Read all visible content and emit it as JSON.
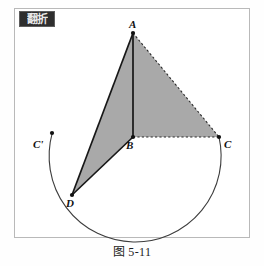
{
  "figure": {
    "badge_text": "翻折",
    "caption": "图 5-11",
    "frame_color": "#b9b9b9",
    "shade_color": "#a8a8a8",
    "stroke_color": "#1b1b1b"
  },
  "labels": {
    "a": "A",
    "b": "B",
    "c": "C",
    "c_prime": "C'",
    "d": "D"
  },
  "geometry": {
    "points": {
      "A": {
        "x": 133,
        "y": 33
      },
      "B": {
        "x": 133,
        "y": 137
      },
      "C": {
        "x": 219,
        "y": 137
      },
      "D": {
        "x": 72,
        "y": 195
      },
      "Cprime": {
        "x": 52,
        "y": 133
      }
    },
    "solid_edges": [
      "A-B",
      "A-D",
      "B-D"
    ],
    "dotted_edges": [
      "A-C",
      "B-C"
    ],
    "shaded_triangles": [
      "A-B-D",
      "A-B-C"
    ],
    "arc": {
      "center": "B",
      "radius": 86,
      "from": "Cprime",
      "through": "D",
      "to": "C"
    }
  }
}
